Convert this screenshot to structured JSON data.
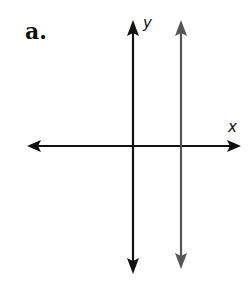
{
  "figure": {
    "label": "a.",
    "x_axis_label": "x",
    "y_axis_label": "y",
    "colors": {
      "axes": "#111111",
      "vertical_line": "#555555",
      "background": "#ffffff"
    },
    "elements": [
      {
        "name": "x-axis",
        "type": "double-arrow line",
        "orientation": "horizontal"
      },
      {
        "name": "y-axis",
        "type": "double-arrow line",
        "orientation": "vertical"
      },
      {
        "name": "vertical-line",
        "type": "double-arrow line",
        "orientation": "vertical",
        "position": "right of y-axis",
        "color": "gray"
      }
    ]
  }
}
